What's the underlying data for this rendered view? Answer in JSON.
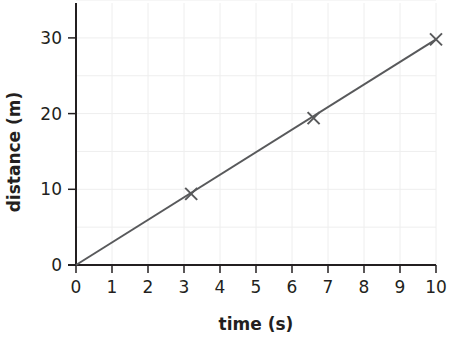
{
  "chart_data": {
    "type": "line",
    "title": "",
    "xlabel": "time (s)",
    "ylabel": "distance (m)",
    "xlim": [
      0,
      10
    ],
    "ylim": [
      0,
      35
    ],
    "x_ticks": [
      0,
      1,
      2,
      3,
      4,
      5,
      6,
      7,
      8,
      9,
      10
    ],
    "y_ticks": [
      0,
      10,
      20,
      30
    ],
    "grid": true,
    "legend": null,
    "series": [
      {
        "name": "best-fit line",
        "kind": "line",
        "x": [
          0,
          10
        ],
        "y": [
          0,
          29.8
        ]
      },
      {
        "name": "measured points",
        "kind": "scatter",
        "marker": "x",
        "x": [
          3.2,
          6.6,
          10
        ],
        "y": [
          9.4,
          19.4,
          29.8
        ]
      }
    ],
    "colors": {
      "axis": "#231f20",
      "line": "#58595b",
      "grid": "#eeeeee"
    }
  }
}
